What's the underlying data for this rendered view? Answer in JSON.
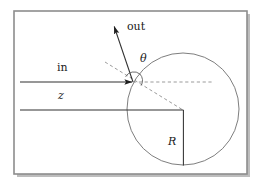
{
  "figure": {
    "frame": {
      "x": 14,
      "y": 11,
      "width": 233,
      "height": 163,
      "border_color": "#8a8a8a",
      "fill": "#ffffff",
      "shadow_color": "#b9b9b9"
    },
    "circle": {
      "cx": 183,
      "cy": 109,
      "r": 56,
      "stroke": "#6b6b6b",
      "label": "R"
    },
    "impact_point": {
      "x": 133,
      "y": 82
    },
    "incoming_ray": {
      "label": "in",
      "x1": 20,
      "y1": 82,
      "x2": 133,
      "y2": 82,
      "stroke": "#3a3a3a"
    },
    "axis_line": {
      "label": "z",
      "x1": 20,
      "y1": 110,
      "x2": 183,
      "y2": 110,
      "stroke": "#3a3a3a"
    },
    "radius_line": {
      "x1": 183,
      "y1": 110,
      "x2": 183,
      "y2": 165,
      "stroke": "#3a3a3a"
    },
    "outgoing_ray": {
      "label": "out",
      "x1": 133,
      "y1": 82,
      "x2": 113,
      "y2": 23,
      "stroke": "#3a3a3a"
    },
    "normal_dashed": {
      "x1": 105,
      "y1": 62,
      "x2": 183,
      "y2": 110,
      "stroke": "#8f8f8f"
    },
    "horizontal_dashed": {
      "x1": 133,
      "y1": 82,
      "x2": 213,
      "y2": 82,
      "stroke": "#8f8f8f"
    },
    "angle_arc": {
      "label": "θ",
      "cx": 133,
      "cy": 82,
      "r": 9,
      "stroke": "#5a5a5a"
    }
  },
  "labels": {
    "out": "out",
    "theta": "θ",
    "in": "in",
    "z": "z",
    "R": "R"
  },
  "label_positions": {
    "out": {
      "x": 127,
      "y": 21
    },
    "theta": {
      "x": 140,
      "y": 53
    },
    "in": {
      "x": 57,
      "y": 62
    },
    "z": {
      "x": 57,
      "y": 90
    },
    "R": {
      "x": 168,
      "y": 137
    }
  }
}
